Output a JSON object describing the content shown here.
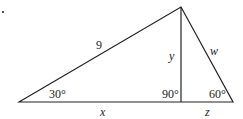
{
  "diagram": {
    "type": "triangle",
    "labels": {
      "hypotenuse": "9",
      "altitude": "y",
      "right_side": "w",
      "base_left": "x",
      "base_right": "z",
      "angle_left": "30°",
      "angle_foot": "90°",
      "angle_right": "60°"
    }
  }
}
